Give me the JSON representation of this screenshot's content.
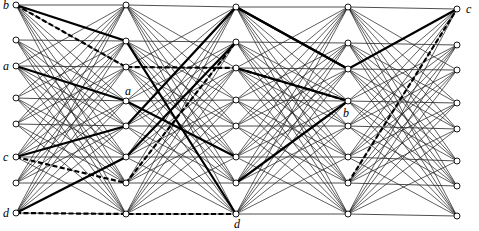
{
  "diagram": {
    "type": "layered-network",
    "columns": [
      {
        "x": 16,
        "ys": [
          5,
          40,
          66,
          98,
          124,
          157,
          183,
          213
        ]
      },
      {
        "x": 126,
        "ys": [
          5,
          41,
          67,
          101,
          126,
          157,
          183,
          214
        ]
      },
      {
        "x": 236,
        "ys": [
          7,
          42,
          68,
          100,
          126,
          157,
          183,
          214
        ]
      },
      {
        "x": 348,
        "ys": [
          7,
          43,
          69,
          101,
          126,
          157,
          183,
          214
        ]
      },
      {
        "x": 457,
        "ys": [
          9,
          45,
          70,
          103,
          129,
          161,
          186,
          216
        ]
      }
    ],
    "node_radius": 3,
    "thin_edge_rule": "each node connects to every node in next column except skip offsets",
    "skip_offsets": [
      1,
      -1
    ],
    "bold_paths": [
      [
        [
          0,
          0
        ],
        [
          1,
          1
        ],
        [
          2,
          7
        ]
      ],
      [
        [
          0,
          2
        ],
        [
          1,
          3
        ],
        [
          2,
          5
        ]
      ],
      [
        [
          0,
          5
        ],
        [
          1,
          4
        ],
        [
          2,
          0
        ],
        [
          3,
          2
        ],
        [
          4,
          0
        ]
      ],
      [
        [
          0,
          7
        ],
        [
          1,
          5
        ],
        [
          2,
          1
        ]
      ],
      [
        [
          2,
          6
        ],
        [
          3,
          3
        ]
      ],
      [
        [
          2,
          0
        ],
        [
          3,
          2
        ]
      ],
      [
        [
          2,
          2
        ],
        [
          3,
          3
        ]
      ]
    ],
    "dashed_paths": [
      [
        [
          0,
          0
        ],
        [
          1,
          2
        ],
        [
          2,
          2
        ],
        [
          3,
          3
        ]
      ],
      [
        [
          0,
          5
        ],
        [
          1,
          6
        ],
        [
          2,
          1
        ]
      ],
      [
        [
          0,
          7
        ],
        [
          1,
          7
        ],
        [
          2,
          7
        ]
      ],
      [
        [
          3,
          6
        ],
        [
          4,
          0
        ]
      ]
    ],
    "labels": [
      {
        "text": "b",
        "col": 0,
        "row": 0,
        "dx": -13,
        "dy": 4
      },
      {
        "text": "a",
        "col": 0,
        "row": 2,
        "dx": -13,
        "dy": 4
      },
      {
        "text": "c",
        "col": 0,
        "row": 5,
        "dx": -13,
        "dy": 4
      },
      {
        "text": "d",
        "col": 0,
        "row": 7,
        "dx": -13,
        "dy": 4
      },
      {
        "text": "a",
        "col": 1,
        "row": 3,
        "dx": -1,
        "dy": -6
      },
      {
        "text": "d",
        "col": 2,
        "row": 7,
        "dx": -2,
        "dy": 14
      },
      {
        "text": "b",
        "col": 3,
        "row": 3,
        "dx": -5,
        "dy": 16
      },
      {
        "text": "c",
        "col": 4,
        "row": 0,
        "dx": 9,
        "dy": 4
      }
    ]
  }
}
